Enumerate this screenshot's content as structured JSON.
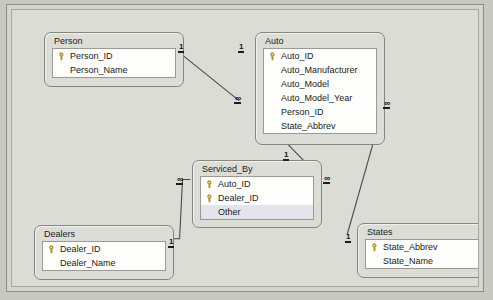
{
  "window": {
    "title": "Relationships"
  },
  "diagram": {
    "type": "entity-relationship",
    "notation": "crow-foot-access",
    "entities": [
      {
        "id": "person",
        "name": "Person",
        "x": 32,
        "y": 22,
        "width": 140,
        "height": 55,
        "fields": [
          {
            "name": "Person_ID",
            "key": true,
            "selected": false
          },
          {
            "name": "Person_Name",
            "key": false,
            "selected": false
          }
        ]
      },
      {
        "id": "auto",
        "name": "Auto",
        "x": 243,
        "y": 22,
        "width": 130,
        "height": 113,
        "fields": [
          {
            "name": "Auto_ID",
            "key": true,
            "selected": false
          },
          {
            "name": "Auto_Manufacturer",
            "key": false,
            "selected": false
          },
          {
            "name": "Auto_Model",
            "key": false,
            "selected": false
          },
          {
            "name": "Auto_Model_Year",
            "key": false,
            "selected": false
          },
          {
            "name": "Person_ID",
            "key": false,
            "selected": false
          },
          {
            "name": "State_Abbrev",
            "key": false,
            "selected": false
          }
        ]
      },
      {
        "id": "serviced_by",
        "name": "Serviced_By",
        "x": 180,
        "y": 150,
        "width": 130,
        "height": 68,
        "fields": [
          {
            "name": "Auto_ID",
            "key": true,
            "selected": false
          },
          {
            "name": "Dealer_ID",
            "key": true,
            "selected": false
          },
          {
            "name": "Other",
            "key": false,
            "selected": true
          }
        ]
      },
      {
        "id": "dealers",
        "name": "Dealers",
        "x": 22,
        "y": 215,
        "width": 140,
        "height": 55,
        "fields": [
          {
            "name": "Dealer_ID",
            "key": true,
            "selected": false
          },
          {
            "name": "Dealer_Name",
            "key": false,
            "selected": false
          }
        ]
      },
      {
        "id": "states",
        "name": "States",
        "x": 345,
        "y": 213,
        "width": 130,
        "height": 55,
        "fields": [
          {
            "name": "State_Abbrev",
            "key": true,
            "selected": false
          },
          {
            "name": "State_Name",
            "key": false,
            "selected": false
          }
        ]
      }
    ],
    "relationships": [
      {
        "id": "person-auto",
        "from": "person",
        "to": "auto",
        "from_cardinality": "1",
        "to_cardinality": "∞",
        "path": "M 166 41 L 229 92"
      },
      {
        "id": "auto-serviced_by",
        "from": "auto",
        "to": "serviced_by",
        "from_cardinality": "1",
        "to_cardinality": "∞",
        "path": "M 278 136 L 311 170"
      },
      {
        "id": "dealers-serviced_by",
        "from": "dealers",
        "to": "serviced_by",
        "from_cardinality": "1",
        "to_cardinality": "∞",
        "path": "M 157 232 L 169 232 L 172 172 L 180 172"
      },
      {
        "id": "auto-states",
        "from": "auto",
        "to": "states",
        "from_cardinality": "∞",
        "to_cardinality": "1",
        "path": "M 375 97 L 338 228"
      }
    ],
    "cardinality_markers": [
      {
        "id": "person-one",
        "label": "1",
        "symbol": "one",
        "x": 166,
        "y": 32
      },
      {
        "id": "auto-one-top",
        "label": "1",
        "symbol": "one",
        "x": 226,
        "y": 32
      },
      {
        "id": "auto-many-left",
        "label": "∞",
        "symbol": "infinity",
        "x": 222,
        "y": 84
      },
      {
        "id": "auto-many-right",
        "label": "∞",
        "symbol": "infinity",
        "x": 371,
        "y": 89
      },
      {
        "id": "auto-one-bottom",
        "label": "1",
        "symbol": "one",
        "x": 271,
        "y": 140
      },
      {
        "id": "serv-many-left",
        "label": "∞",
        "symbol": "infinity",
        "x": 164,
        "y": 165
      },
      {
        "id": "serv-many-right",
        "label": "∞",
        "symbol": "infinity",
        "x": 311,
        "y": 164
      },
      {
        "id": "dealers-one",
        "label": "1",
        "symbol": "one",
        "x": 156,
        "y": 227
      },
      {
        "id": "states-one",
        "label": "1",
        "symbol": "one",
        "x": 333,
        "y": 222
      }
    ]
  },
  "colors": {
    "canvas_background": "#dcdcd7",
    "window_chrome": "#d6d6d1",
    "entity_fill": "#ddddd8",
    "entity_border": "#86867f",
    "field_list_fill": "#fdfdfb",
    "selected_row": "#e4e4ec",
    "connector": "#4a4a47",
    "text": "#1a1a18",
    "key_icon": "#b8a032"
  },
  "icons": {
    "primary_key": "key-icon"
  }
}
